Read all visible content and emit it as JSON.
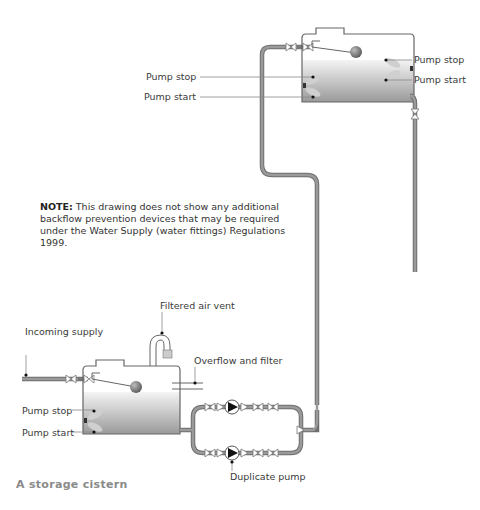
{
  "figure": {
    "caption": "A storage cistern",
    "note_label": "NOTE:",
    "note_text": " This drawing does not show any additional backflow prevention devices that may be required under the Water Supply (water fittings) Regulations 1999."
  },
  "upper_cistern": {
    "left_labels": {
      "pump_stop": "Pump stop",
      "pump_start": "Pump start"
    },
    "right_labels": {
      "pump_stop": "Pump stop",
      "pump_start": "Pump start"
    }
  },
  "lower_cistern": {
    "incoming_supply": "Incoming supply",
    "filtered_air_vent": "Filtered air vent",
    "overflow_and_filter": "Overflow and filter",
    "pump_stop": "Pump stop",
    "pump_start": "Pump start",
    "duplicate_pump": "Duplicate pump"
  },
  "colors": {
    "pipe": "#8a8a8a",
    "pipe_outline": "#6e6e6e",
    "water_top": "#f2f2f2",
    "water_bottom": "#9c9c9c",
    "float_switch": "#c9c9c9",
    "label_text": "#3a3a3a",
    "caption_text": "#8a8a8a"
  }
}
